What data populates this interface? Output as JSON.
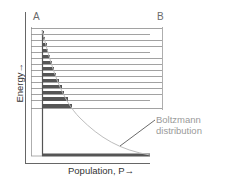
{
  "diagram": {
    "corner_labels": {
      "left": "A",
      "right": "B"
    },
    "y_axis_label": "Energy→",
    "x_axis_label": "Population, P→",
    "annotation": {
      "line1": "Boltzmann",
      "line2": "distribution"
    },
    "energy_levels_count": 14,
    "colors": {
      "axis": "#555555",
      "level_line": "#8a8a8a",
      "population_bar": "#555555",
      "curve": "#bdbdbd",
      "annotation_text": "#9a9a9a",
      "label_text": "#333333"
    }
  }
}
